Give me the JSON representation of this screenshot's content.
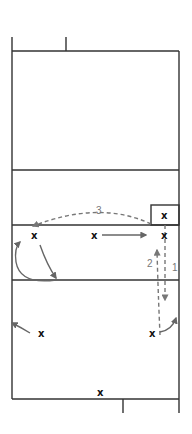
{
  "diagram": {
    "type": "volleyball-court-play",
    "player_marker": "x",
    "colors": {
      "court_line": "#333333",
      "movement_arrow": "#666666",
      "pass_arrow": "#777777",
      "marker": "#111111",
      "label": "#777777"
    },
    "labels": {
      "pass1": "1",
      "pass2": "2",
      "pass3": "3"
    },
    "players": [
      {
        "id": "setter-box",
        "label": "x"
      },
      {
        "id": "left-front",
        "label": "x"
      },
      {
        "id": "middle-front",
        "label": "x"
      },
      {
        "id": "right-front",
        "label": "x"
      },
      {
        "id": "left-back",
        "label": "x"
      },
      {
        "id": "right-back",
        "label": "x"
      },
      {
        "id": "server",
        "label": "x"
      }
    ]
  }
}
